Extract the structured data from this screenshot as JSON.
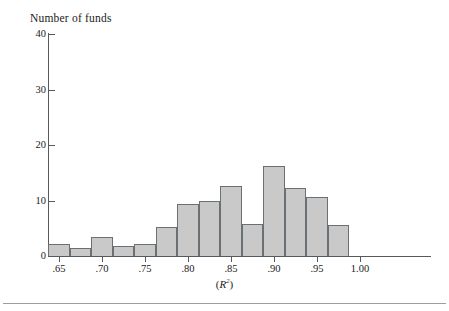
{
  "figure": {
    "ylabel": "Number of funds",
    "xlabel_prefix": "(",
    "xlabel_symbol": "R",
    "xlabel_exponent": "2",
    "xlabel_suffix": ")",
    "bar_fill_color": "#c9c9c9",
    "bar_border_color": "#6b7074",
    "axis_color": "#555a5e"
  },
  "chart_data": {
    "type": "bar",
    "title": "",
    "subtitle": "",
    "xlabel": "(R2)",
    "ylabel": "Number of funds",
    "xlim": [
      0.6375,
      1.0125
    ],
    "ylim": [
      0,
      40
    ],
    "bin_width": 0.025,
    "grid": false,
    "legend": null,
    "y_ticks": [
      0,
      10,
      20,
      30,
      40
    ],
    "y_tick_labels": [
      "0",
      "10",
      "20",
      "30",
      "40"
    ],
    "x_ticks": [
      0.65,
      0.7,
      0.75,
      0.8,
      0.85,
      0.9,
      0.95,
      1.0
    ],
    "x_tick_labels": [
      ".65",
      ".70",
      ".75",
      ".80",
      ".85",
      ".90",
      ".95",
      "1.00"
    ],
    "bins": [
      {
        "left": 0.6375,
        "right": 0.6625,
        "value": 2.2
      },
      {
        "left": 0.6625,
        "right": 0.6875,
        "value": 1.5
      },
      {
        "left": 0.6875,
        "right": 0.7125,
        "value": 3.5
      },
      {
        "left": 0.7125,
        "right": 0.7375,
        "value": 1.8
      },
      {
        "left": 0.7375,
        "right": 0.7625,
        "value": 2.2
      },
      {
        "left": 0.7625,
        "right": 0.7875,
        "value": 5.3
      },
      {
        "left": 0.7875,
        "right": 0.8125,
        "value": 9.3
      },
      {
        "left": 0.8125,
        "right": 0.8375,
        "value": 10.0
      },
      {
        "left": 0.8375,
        "right": 0.8625,
        "value": 12.7
      },
      {
        "left": 0.8625,
        "right": 0.8875,
        "value": 5.8
      },
      {
        "left": 0.8875,
        "right": 0.9125,
        "value": 16.2
      },
      {
        "left": 0.9125,
        "right": 0.9375,
        "value": 12.3
      },
      {
        "left": 0.9375,
        "right": 0.9625,
        "value": 10.7
      },
      {
        "left": 0.9625,
        "right": 0.9875,
        "value": 5.5
      }
    ],
    "categories": [
      ".6375-.6625",
      ".6625-.6875",
      ".6875-.7125",
      ".7125-.7375",
      ".7375-.7625",
      ".7625-.7875",
      ".7875-.8125",
      ".8125-.8375",
      ".8375-.8625",
      ".8625-.8875",
      ".8875-.9125",
      ".9125-.9375",
      ".9375-.9625",
      ".9625-.9875"
    ],
    "values": [
      2.2,
      1.5,
      3.5,
      1.8,
      2.2,
      5.3,
      9.3,
      10.0,
      12.7,
      5.8,
      16.2,
      12.3,
      10.7,
      5.5
    ]
  }
}
